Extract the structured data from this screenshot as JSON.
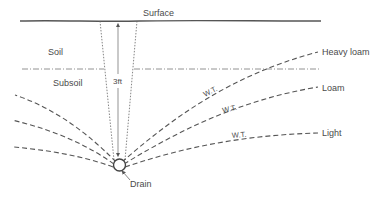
{
  "diagram": {
    "labels": {
      "surface": "Surface",
      "soil": "Soil",
      "subsoil": "Subsoil",
      "depth": "3ft",
      "drain": "Drain"
    },
    "water_tables": [
      {
        "soil_type": "Heavy loam",
        "wt_label": "W.T."
      },
      {
        "soil_type": "Loam",
        "wt_label": "W.T."
      },
      {
        "soil_type": "Light",
        "wt_label": "W.T."
      }
    ],
    "colors": {
      "line": "#555555",
      "text": "#4a4a4a",
      "background": "#ffffff"
    }
  }
}
